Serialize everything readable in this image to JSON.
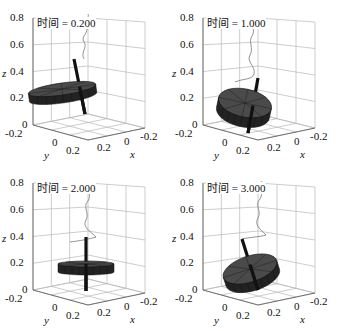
{
  "figure": {
    "panels": [
      {
        "id": "p1",
        "time_label": "时间 = 0.200",
        "disk_tilt": -8,
        "disk_cx": 62,
        "disk_cy": 89,
        "disk_rx": 34,
        "disk_ry": 6,
        "disk_h": 8,
        "rod": {
          "x1": 74,
          "y1": 59,
          "x2": 85,
          "y2": 114
        },
        "trail": "M84,59 C80,52 88,48 84,42 C80,36 90,33 86,26 C83,20 90,18 88,14"
      },
      {
        "id": "p2",
        "time_label": "时间 = 1.000",
        "disk_tilt": 12,
        "disk_cx": 75,
        "disk_cy": 103,
        "disk_rx": 27,
        "disk_ry": 14,
        "disk_h": 10,
        "rod": {
          "x1": 88,
          "y1": 78,
          "x2": 78,
          "y2": 133
        },
        "trail": "M65,82 C75,78 82,80 84,74 C86,66 76,62 80,55 C84,48 78,42 82,36 C86,30 80,24 84,18"
      },
      {
        "id": "p3",
        "time_label": "时间 = 2.000",
        "disk_tilt": 0,
        "disk_cx": 86,
        "disk_cy": 99,
        "disk_rx": 28,
        "disk_ry": 3,
        "disk_h": 8,
        "rod": {
          "x1": 86,
          "y1": 72,
          "x2": 86,
          "y2": 126
        },
        "trail": "M70,77 C78,76 90,74 96,72 C90,66 82,62 86,55 C90,48 82,42 88,36 C92,30 86,24 90,18"
      },
      {
        "id": "p4",
        "time_label": "时间 = 3.000",
        "disk_tilt": -18,
        "disk_cx": 80,
        "disk_cy": 104,
        "disk_rx": 28,
        "disk_ry": 13,
        "disk_h": 9,
        "rod": {
          "x1": 72,
          "y1": 74,
          "x2": 88,
          "y2": 125
        },
        "trail": "M72,74 C80,72 90,72 96,70 C90,64 84,60 88,53 C92,46 84,40 90,34 C94,28 88,22 92,16"
      }
    ],
    "axes": {
      "z_label": "z",
      "x_label": "x",
      "y_label": "y",
      "z_ticks": [
        "0.8",
        "0.6",
        "0.4",
        "0.2",
        "0"
      ],
      "y_ticks": [
        "-0.2",
        "0",
        "0.2"
      ],
      "x_ticks": [
        "0.2",
        "0",
        "-0.2"
      ]
    },
    "colors": {
      "grid": "#b8b8b8",
      "disk_top": "#4a4a4a",
      "disk_side": "#222222",
      "rod": "#111111",
      "trail": "#777777"
    }
  }
}
